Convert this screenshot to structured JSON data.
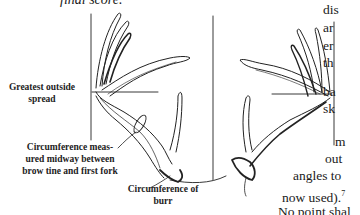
{
  "top_caption": "final score.",
  "figure": {
    "labels": {
      "greatest_spread": "Greatest outside spread",
      "circumference_mid": "Circumference meas- ured midway between brow tine and first fork",
      "circumference_mid_lines": [
        "Circumference meas-",
        "ured midway between",
        "brow tine and first fork"
      ],
      "circumference_burr_lines": [
        "Circumference of",
        "burr"
      ]
    }
  },
  "body_text_fragments": [
    {
      "text": "dis",
      "x": 323,
      "y": 2
    },
    {
      "text": "ar",
      "x": 323,
      "y": 20
    },
    {
      "text": "er",
      "x": 323,
      "y": 38
    },
    {
      "text": "th",
      "x": 323,
      "y": 55
    },
    {
      "text": "ba",
      "x": 323,
      "y": 84
    },
    {
      "text": "sk",
      "x": 323,
      "y": 101
    },
    {
      "text": "m",
      "x": 335,
      "y": 134
    },
    {
      "text": "out",
      "x": 325,
      "y": 151
    },
    {
      "text": "angles to",
      "x": 293,
      "y": 168
    },
    {
      "text": "now used).",
      "x": 282,
      "y": 186,
      "sup": "7"
    },
    {
      "text": "No point shal",
      "x": 278,
      "y": 204
    }
  ]
}
